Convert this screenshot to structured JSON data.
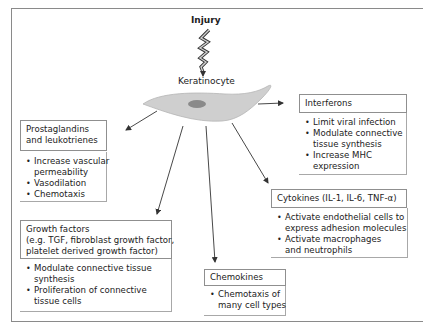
{
  "diagram": {
    "trigger": "Injury",
    "cell": "Keratinocyte",
    "colors": {
      "cell_fill": "#cfcfcf",
      "nucleus_fill": "#8a8a8a",
      "border": "#8f8f8f",
      "arrow": "#333333"
    },
    "boxes": {
      "prostaglandins": {
        "header": [
          "Prostaglandins",
          "and leukotrienes"
        ],
        "bullets": [
          [
            "Increase vascular",
            "permeability"
          ],
          [
            "Vasodilation"
          ],
          [
            "Chemotaxis"
          ]
        ]
      },
      "interferons": {
        "header": [
          "Interferons"
        ],
        "bullets": [
          [
            "Limit viral infection"
          ],
          [
            "Modulate connective",
            "tissue synthesis"
          ],
          [
            "Increase MHC",
            "expression"
          ]
        ]
      },
      "cytokines": {
        "header": [
          "Cytokines (IL-1, IL-6, TNF-α)"
        ],
        "bullets": [
          [
            "Activate endothelial cells to",
            "express adhesion molecules"
          ],
          [
            "Activate macrophages",
            "and neutrophils"
          ]
        ]
      },
      "growth_factors": {
        "header": [
          "Growth factors",
          "(e.g. TGF, fibroblast growth factor,",
          "platelet derived growth factor)"
        ],
        "bullets": [
          [
            "Modulate connective tissue",
            "synthesis"
          ],
          [
            "Proliferation of connective",
            "tissue cells"
          ]
        ]
      },
      "chemokines": {
        "header": [
          "Chemokines"
        ],
        "bullets": [
          [
            "Chemotaxis of",
            "many cell types"
          ]
        ]
      }
    }
  }
}
